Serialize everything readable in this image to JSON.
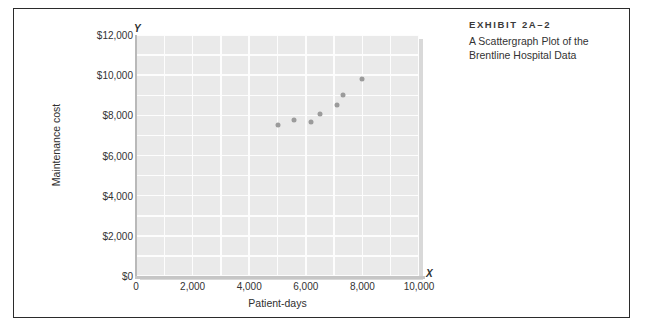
{
  "caption": {
    "exhibit_label": "EXHIBIT 2A–2",
    "line1": "A Scattergraph Plot of the",
    "line2": "Brentline Hospital Data"
  },
  "chart_data": {
    "type": "scatter",
    "title": "A Scattergraph Plot of the Brentline Hospital Data",
    "xlabel": "Patient-days",
    "ylabel": "Maintenance cost",
    "x_axis_letter": "X",
    "y_axis_letter": "Y",
    "xlim": [
      0,
      10000
    ],
    "ylim": [
      0,
      12000
    ],
    "xticks": [
      0,
      2000,
      4000,
      6000,
      8000,
      10000
    ],
    "xtick_labels": [
      "0",
      "2,000",
      "4,000",
      "6,000",
      "8,000",
      "10,000"
    ],
    "yticks": [
      0,
      2000,
      4000,
      6000,
      8000,
      10000,
      12000
    ],
    "ytick_labels": [
      "$0",
      "$2,000",
      "$4,000",
      "$6,000",
      "$8,000",
      "$10,000",
      "$12,000"
    ],
    "grid": true,
    "legend": null,
    "plot_background": "#eaeaea",
    "gridline_color": "#fdfdfd",
    "marker_color": "#9b9b9b",
    "points": [
      {
        "x": 5000,
        "y": 7500
      },
      {
        "x": 5600,
        "y": 7750
      },
      {
        "x": 6200,
        "y": 7650
      },
      {
        "x": 6500,
        "y": 8050
      },
      {
        "x": 7100,
        "y": 8500
      },
      {
        "x": 7300,
        "y": 9000
      },
      {
        "x": 8000,
        "y": 9800
      }
    ]
  }
}
